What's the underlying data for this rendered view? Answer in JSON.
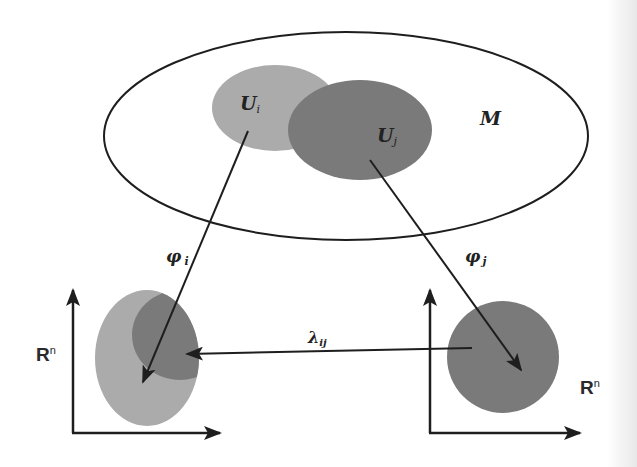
{
  "diagram": {
    "manifold": {
      "label": "M"
    },
    "open_sets": [
      {
        "id": "Ui",
        "label_main": "U",
        "label_sub": "i",
        "color": "#ababab"
      },
      {
        "id": "Uj",
        "label_main": "U",
        "label_sub": "j",
        "color": "#7a7a7a"
      }
    ],
    "maps": [
      {
        "id": "phi_i",
        "label_main": "φ",
        "label_sub": "i",
        "from": "Ui",
        "to": "Rn_left"
      },
      {
        "id": "phi_j",
        "label_main": "φ",
        "label_sub": "j",
        "from": "Uj",
        "to": "Rn_right"
      },
      {
        "id": "lambda_ij",
        "label_main": "λ",
        "label_sub": "ij",
        "from": "Rn_right",
        "to": "Rn_left"
      }
    ],
    "spaces": [
      {
        "id": "Rn_left",
        "label_main": "R",
        "label_sup": "n"
      },
      {
        "id": "Rn_right",
        "label_main": "R",
        "label_sup": "n"
      }
    ],
    "colors": {
      "line": "#1e1e1e",
      "light_region": "#ababab",
      "dark_region": "#7a7a7a",
      "background": "#ffffff"
    }
  }
}
